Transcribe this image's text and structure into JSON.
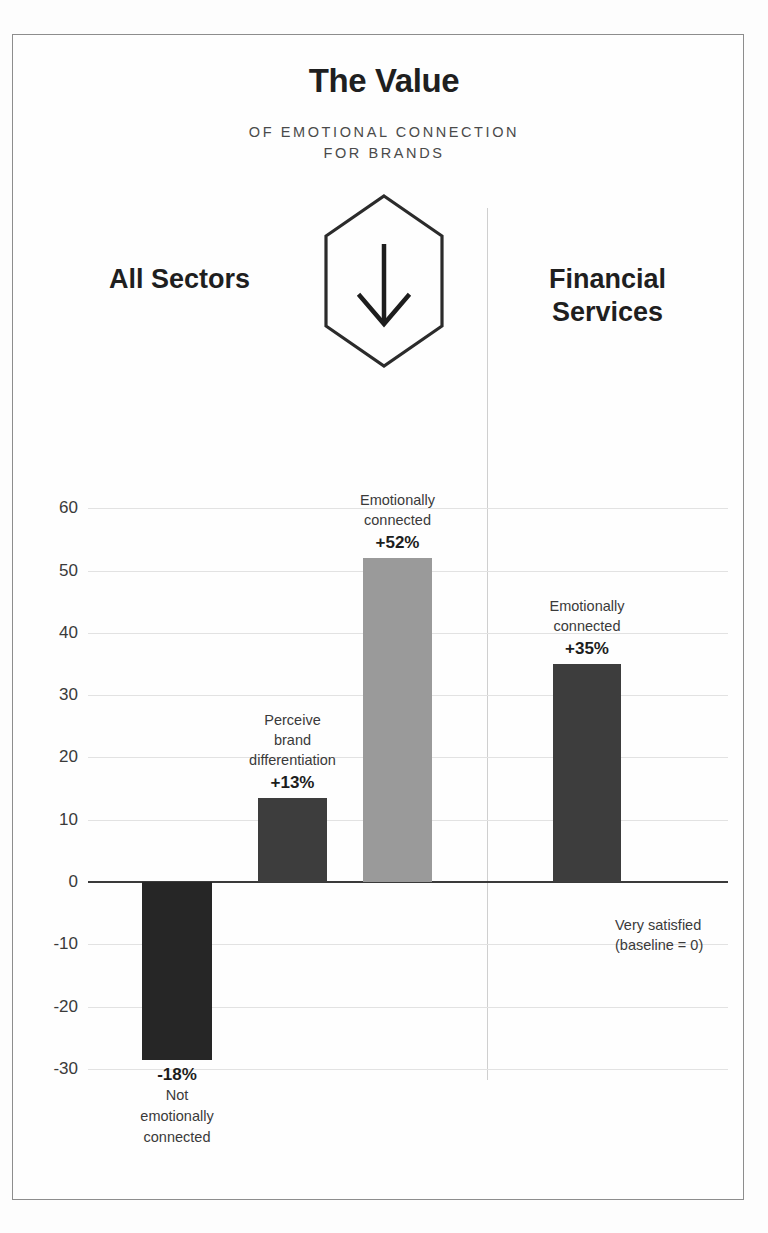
{
  "header": {
    "title": "The Value",
    "subtitle_line1": "OF EMOTIONAL CONNECTION",
    "subtitle_line2": "FOR BRANDS",
    "badge_icon": "hexagon-down-arrow-icon",
    "left_sector": "All Sectors",
    "right_sector_line1": "Financial",
    "right_sector_line2": "Services"
  },
  "annotations": {
    "baseline_line1": "Very satisfied",
    "baseline_line2": "(baseline = 0)"
  },
  "colors": {
    "bar_darkest": "#262626",
    "bar_dark": "#3d3d3d",
    "bar_mid": "#9a9a9a",
    "grid": "#e2e2e2",
    "axis": "#3a3a3a",
    "frame": "#8d8d8d"
  },
  "chart_data": {
    "type": "bar",
    "xlabel": "",
    "ylabel": "",
    "ylim": [
      -30,
      60
    ],
    "ytick_values": [
      60,
      50,
      40,
      30,
      20,
      10,
      0,
      -10,
      -20,
      -30
    ],
    "ytick_labels": [
      "60",
      "50",
      "40",
      "30",
      "20",
      "10",
      "0",
      "-10",
      "-20",
      "-30"
    ],
    "grid": true,
    "legend": "none",
    "groups": [
      {
        "name": "All Sectors",
        "bar_indices": [
          0,
          1,
          2
        ]
      },
      {
        "name": "Financial Services",
        "bar_indices": [
          3
        ]
      }
    ],
    "bars": [
      {
        "label_line1": "Not",
        "label_line2": "emotionally",
        "label_line3": "connected",
        "value_label": "-18%",
        "value": -28.5,
        "stated_value": -18,
        "color": "#262626",
        "label_position": "below",
        "group": "All Sectors"
      },
      {
        "label_line1": "Perceive",
        "label_line2": "brand",
        "label_line3": "differentiation",
        "value_label": "+13%",
        "value": 13.5,
        "stated_value": 13,
        "color": "#3d3d3d",
        "label_position": "above",
        "group": "All Sectors"
      },
      {
        "label_line1": "Emotionally",
        "label_line2": "connected",
        "label_line3": "",
        "value_label": "+52%",
        "value": 52,
        "stated_value": 52,
        "color": "#9a9a9a",
        "label_position": "above",
        "group": "All Sectors"
      },
      {
        "label_line1": "Emotionally",
        "label_line2": "connected",
        "label_line3": "",
        "value_label": "+35%",
        "value": 35,
        "stated_value": 35,
        "color": "#3d3d3d",
        "label_position": "above",
        "group": "Financial Services"
      }
    ]
  }
}
